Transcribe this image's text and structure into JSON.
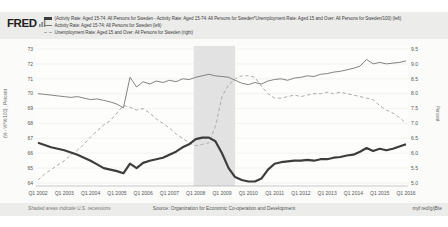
{
  "header": {
    "logo_text": "FRED",
    "legend": [
      {
        "label": "(Activity Rate: Aged 15-74: All Persons for Sweden - Activity Rate: Aged 15-74: All Persons for Sweden*Unemployment Rate: Aged 15 and Over: All Persons for Sweden/100) (left)",
        "marker": "thick-solid",
        "color": "#3d3d3d"
      },
      {
        "label": "Activity Rate: Aged 15-74: All Persons for Sweden (left)",
        "marker": "thin-solid",
        "color": "#757575"
      },
      {
        "label": "Unemployment Rate: Aged 15 and Over: All Persons for Sweden (right)",
        "marker": "dashed",
        "color": "#adadad"
      }
    ]
  },
  "footer": {
    "recession_note": "Shaded areas indicate U.S. recessions",
    "source": "Source: Organization for Economic Co-operation and Development",
    "share_url": "myf.red/g/jBte"
  },
  "chart_data": {
    "type": "line",
    "frequency": "quarterly",
    "quarters": [
      "2002Q1",
      "2002Q2",
      "2002Q3",
      "2002Q4",
      "2003Q1",
      "2003Q2",
      "2003Q3",
      "2003Q4",
      "2004Q1",
      "2004Q2",
      "2004Q3",
      "2004Q4",
      "2005Q1",
      "2005Q2",
      "2005Q3",
      "2005Q4",
      "2006Q1",
      "2006Q2",
      "2006Q3",
      "2006Q4",
      "2007Q1",
      "2007Q2",
      "2007Q3",
      "2007Q4",
      "2008Q1",
      "2008Q2",
      "2008Q3",
      "2008Q4",
      "2009Q1",
      "2009Q2",
      "2009Q3",
      "2009Q4",
      "2010Q1",
      "2010Q2",
      "2010Q3",
      "2010Q4",
      "2011Q1",
      "2011Q2",
      "2011Q3",
      "2011Q4",
      "2012Q1",
      "2012Q2",
      "2012Q3",
      "2012Q4",
      "2013Q1",
      "2013Q2",
      "2013Q3",
      "2013Q4",
      "2014Q1",
      "2014Q2",
      "2014Q3",
      "2014Q4",
      "2015Q1",
      "2015Q2",
      "2015Q3",
      "2015Q4",
      "2016Q1"
    ],
    "x_tick_labels": [
      "Q1 2002",
      "Q1 2003",
      "Q1 2004",
      "Q1 2005",
      "Q1 2006",
      "Q1 2007",
      "Q1 2008",
      "Q1 2009",
      "Q1 2010",
      "Q1 2011",
      "Q1 2012",
      "Q1 2013",
      "Q1 2014",
      "Q1 2015",
      "Q1 2016"
    ],
    "left_axis": {
      "label": "(% - %*%/100) , Percent",
      "ticks": [
        64,
        65,
        66,
        67,
        68,
        69,
        70,
        71,
        72,
        73
      ],
      "range": [
        63.8,
        73.2
      ]
    },
    "right_axis": {
      "label": "Percent",
      "ticks": [
        "5.0",
        "5.5",
        "6.0",
        "6.5",
        "7.0",
        "7.5",
        "8.0",
        "8.5",
        "9.0",
        "9.5"
      ],
      "range": [
        4.9,
        9.6
      ]
    },
    "recession_bands": [
      {
        "start": "2007Q4",
        "end": "2009Q2",
        "start_index": 23.7,
        "end_index": 30
      }
    ],
    "grid": true,
    "legend_position": "top-left",
    "series": [
      {
        "name": "(Activity Rate - Activity Rate*Unemployment Rate/100) (left)",
        "axis": "left",
        "style": "thick-solid",
        "color": "#3d3d3d",
        "values": [
          66.7,
          66.55,
          66.4,
          66.3,
          66.2,
          66.05,
          65.9,
          65.7,
          65.5,
          65.25,
          65.0,
          64.9,
          64.8,
          64.65,
          65.3,
          65.0,
          65.35,
          65.5,
          65.6,
          65.7,
          65.9,
          66.1,
          66.4,
          66.6,
          66.95,
          67.05,
          67.05,
          66.8,
          66.0,
          65.0,
          64.4,
          64.2,
          64.1,
          64.1,
          64.3,
          64.9,
          65.3,
          65.4,
          65.45,
          65.5,
          65.5,
          65.55,
          65.5,
          65.6,
          65.6,
          65.7,
          65.75,
          65.85,
          65.9,
          66.1,
          66.35,
          66.15,
          66.3,
          66.2,
          66.3,
          66.45,
          66.6
        ]
      },
      {
        "name": "Activity Rate: Aged 15-74: All Persons for Sweden (left)",
        "axis": "left",
        "style": "thin-solid",
        "color": "#757575",
        "values": [
          70.0,
          69.95,
          69.9,
          69.85,
          69.8,
          69.75,
          69.8,
          69.7,
          69.6,
          69.65,
          69.55,
          69.45,
          69.3,
          69.05,
          71.1,
          70.45,
          70.8,
          70.65,
          70.85,
          70.75,
          70.9,
          70.8,
          71.0,
          70.95,
          71.1,
          71.2,
          71.3,
          71.2,
          71.15,
          71.1,
          70.9,
          70.7,
          70.6,
          70.75,
          70.65,
          70.85,
          70.95,
          71.0,
          70.9,
          71.05,
          71.1,
          71.2,
          71.15,
          71.3,
          71.35,
          71.45,
          71.5,
          71.6,
          71.7,
          71.85,
          72.3,
          72.0,
          72.1,
          72.0,
          72.05,
          72.1,
          72.2
        ]
      },
      {
        "name": "Unemployment Rate: Aged 15 and Over: All Persons for Sweden (right)",
        "axis": "right",
        "style": "dashed",
        "color": "#adadad",
        "values": [
          5.1,
          5.3,
          5.45,
          5.6,
          5.75,
          5.95,
          6.1,
          6.3,
          6.55,
          6.75,
          6.95,
          7.1,
          7.35,
          7.6,
          7.55,
          7.45,
          7.5,
          7.35,
          7.15,
          7.0,
          6.85,
          6.65,
          6.5,
          6.35,
          6.25,
          6.3,
          6.35,
          6.9,
          7.9,
          8.3,
          8.5,
          8.6,
          8.6,
          8.55,
          8.25,
          8.0,
          7.85,
          7.85,
          7.9,
          7.95,
          7.9,
          7.95,
          8.0,
          8.0,
          8.05,
          8.0,
          8.05,
          8.0,
          7.95,
          7.9,
          7.85,
          7.8,
          7.6,
          7.45,
          7.35,
          7.2,
          7.0
        ]
      }
    ]
  }
}
